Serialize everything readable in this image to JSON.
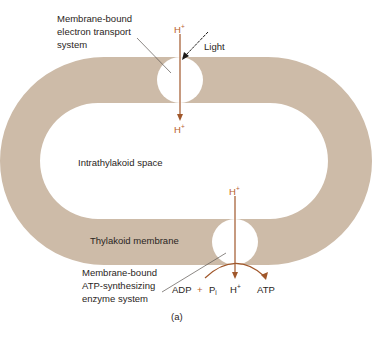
{
  "figure": {
    "caption": "(a)",
    "colors": {
      "membrane": "#cdbba8",
      "proton_arrow": "#a0572a",
      "text": "#2a2522",
      "proton_text": "#b8622a"
    },
    "labels": {
      "electron_transport": [
        "Membrane-bound",
        "electron transport",
        "system"
      ],
      "light": "Light",
      "intrathylakoid_space": "Intrathylakoid space",
      "thylakoid_membrane": "Thylakoid membrane",
      "atp_synthase": [
        "Membrane-bound",
        "ATP-synthesizing",
        "enzyme system"
      ]
    },
    "protons": {
      "symbol": "H",
      "charge": "+",
      "top_in": "H",
      "top_out": "H",
      "bottom_in": "H",
      "bottom_out": "H"
    },
    "reaction": {
      "adp": "ADP",
      "plus": "+",
      "pi": "P",
      "pi_sub": "i",
      "atp": "ATP"
    }
  }
}
